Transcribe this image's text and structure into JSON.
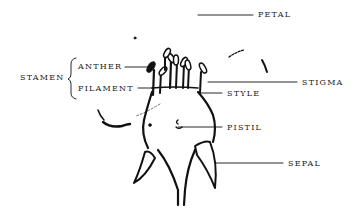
{
  "diagram": {
    "type": "labeled flower anatomy illustration",
    "labels": {
      "petal": "PETAL",
      "stamen": "STAMEN",
      "anther": "ANTHER",
      "filament": "FILAMENT",
      "stigma": "STIGMA",
      "style": "STYLE",
      "pistil": "PISTIL",
      "sepal": "SEPAL"
    },
    "ink_color": "#111111"
  }
}
